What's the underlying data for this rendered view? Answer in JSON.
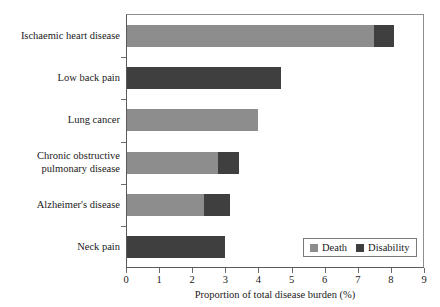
{
  "chart_data": {
    "type": "bar",
    "orientation": "horizontal",
    "stacked": true,
    "title": "",
    "xlabel": "Proportion of total disease burden (%)",
    "ylabel": "",
    "xlim": [
      0,
      9
    ],
    "xticks": [
      0,
      1,
      2,
      3,
      4,
      5,
      6,
      7,
      8,
      9
    ],
    "xticklabels": [
      "0",
      "1",
      "2",
      "3",
      "4",
      "5",
      "6",
      "7",
      "8",
      "9"
    ],
    "grid": false,
    "legend_position": "bottom-right",
    "categories": [
      "Ischaemic heart disease",
      "Low back pain",
      "Lung cancer",
      "Chronic obstructive pulmonary disease",
      "Alzheimer's disease",
      "Neck pain"
    ],
    "category_lines": [
      [
        "Ischaemic heart disease"
      ],
      [
        "Low back pain"
      ],
      [
        "Lung cancer"
      ],
      [
        "Chronic obstructive",
        "pulmonary disease"
      ],
      [
        "Alzheimer's disease"
      ],
      [
        "Neck pain"
      ]
    ],
    "series": [
      {
        "name": "Death",
        "color": "#8d8d8d",
        "values": [
          7.45,
          0.0,
          3.95,
          2.75,
          2.33,
          0.0
        ]
      },
      {
        "name": "Disability",
        "color": "#3f3f3f",
        "values": [
          0.6,
          4.65,
          0.0,
          0.63,
          0.78,
          2.96
        ]
      }
    ],
    "totals": [
      8.05,
      4.65,
      3.95,
      3.38,
      3.11,
      2.96
    ]
  },
  "legend": {
    "items": [
      {
        "label": "Death",
        "color": "#8d8d8d"
      },
      {
        "label": "Disability",
        "color": "#3f3f3f"
      }
    ]
  }
}
